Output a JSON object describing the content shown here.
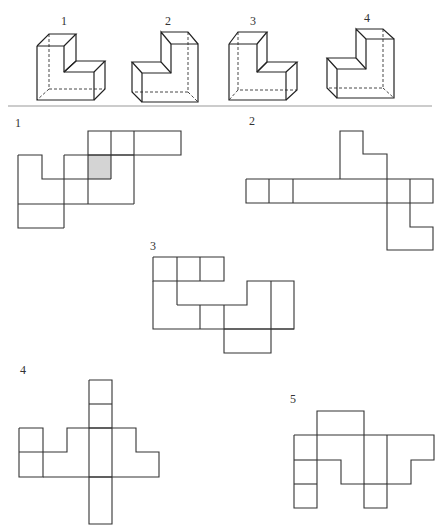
{
  "divider": {
    "x1": 8,
    "x2": 432,
    "y": 106,
    "color": "#999999"
  },
  "solids": [
    {
      "label": "1",
      "label_pos": [
        61,
        25
      ],
      "solid": [
        [
          [
            37,
            46
          ],
          [
            64,
            46
          ],
          [
            64,
            72
          ],
          [
            94,
            72
          ],
          [
            94,
            100
          ],
          [
            37,
            100
          ],
          [
            37,
            46
          ]
        ],
        [
          [
            37,
            46
          ],
          [
            49,
            34
          ],
          [
            76,
            34
          ],
          [
            64,
            46
          ]
        ],
        [
          [
            76,
            34
          ],
          [
            76,
            61
          ],
          [
            64,
            72
          ]
        ],
        [
          [
            64,
            72
          ],
          [
            76,
            61
          ],
          [
            105,
            61
          ],
          [
            94,
            72
          ]
        ],
        [
          [
            105,
            61
          ],
          [
            105,
            89
          ],
          [
            94,
            100
          ]
        ]
      ],
      "thin": [],
      "dashed": [
        [
          [
            49,
            34
          ],
          [
            49,
            89
          ],
          [
            105,
            89
          ]
        ],
        [
          [
            49,
            89
          ],
          [
            37,
            100
          ]
        ]
      ]
    },
    {
      "label": "2",
      "label_pos": [
        165,
        25
      ],
      "solid": [
        [
          [
            142,
            73
          ],
          [
            171,
            73
          ],
          [
            171,
            44
          ],
          [
            198,
            44
          ],
          [
            198,
            102
          ],
          [
            142,
            102
          ],
          [
            142,
            73
          ]
        ],
        [
          [
            171,
            73
          ],
          [
            161,
            62
          ],
          [
            161,
            32
          ],
          [
            171,
            44
          ]
        ],
        [
          [
            161,
            32
          ],
          [
            188,
            32
          ],
          [
            198,
            44
          ]
        ],
        [
          [
            142,
            73
          ],
          [
            132,
            62
          ],
          [
            161,
            62
          ]
        ],
        [
          [
            132,
            62
          ],
          [
            132,
            92
          ],
          [
            142,
            102
          ]
        ]
      ],
      "thin": [],
      "dashed": [
        [
          [
            188,
            32
          ],
          [
            188,
            92
          ],
          [
            132,
            92
          ]
        ],
        [
          [
            188,
            92
          ],
          [
            198,
            102
          ]
        ]
      ]
    },
    {
      "label": "3",
      "label_pos": [
        250,
        25
      ],
      "solid": [
        [
          [
            229,
            44
          ],
          [
            257,
            44
          ],
          [
            257,
            72
          ],
          [
            286,
            72
          ],
          [
            286,
            100
          ],
          [
            229,
            100
          ],
          [
            229,
            44
          ]
        ],
        [
          [
            229,
            44
          ],
          [
            238,
            32
          ],
          [
            267,
            32
          ],
          [
            257,
            44
          ]
        ],
        [
          [
            267,
            32
          ],
          [
            267,
            62
          ],
          [
            257,
            72
          ]
        ],
        [
          [
            257,
            72
          ],
          [
            267,
            62
          ],
          [
            297,
            62
          ],
          [
            286,
            72
          ]
        ],
        [
          [
            297,
            62
          ],
          [
            297,
            90
          ],
          [
            286,
            100
          ]
        ]
      ],
      "thin": [],
      "dashed": [
        [
          [
            238,
            32
          ],
          [
            238,
            90
          ],
          [
            297,
            90
          ]
        ],
        [
          [
            238,
            90
          ],
          [
            229,
            100
          ]
        ]
      ]
    },
    {
      "label": "4",
      "label_pos": [
        364,
        22
      ],
      "solid": [
        [
          [
            337,
            69
          ],
          [
            366,
            69
          ],
          [
            366,
            39
          ],
          [
            394,
            39
          ],
          [
            394,
            98
          ],
          [
            337,
            98
          ],
          [
            337,
            69
          ]
        ],
        [
          [
            366,
            69
          ],
          [
            356,
            58
          ],
          [
            356,
            29
          ],
          [
            366,
            39
          ]
        ],
        [
          [
            356,
            29
          ],
          [
            383,
            29
          ],
          [
            394,
            39
          ]
        ],
        [
          [
            337,
            69
          ],
          [
            327,
            58
          ],
          [
            356,
            58
          ]
        ],
        [
          [
            327,
            58
          ],
          [
            327,
            88
          ],
          [
            337,
            98
          ]
        ]
      ],
      "thin": [],
      "dashed": [
        [
          [
            383,
            29
          ],
          [
            383,
            88
          ],
          [
            327,
            88
          ]
        ],
        [
          [
            383,
            88
          ],
          [
            394,
            98
          ]
        ]
      ]
    }
  ],
  "nets": [
    {
      "label": "1",
      "label_pos": [
        15,
        127
      ],
      "shaded": [
        [
          88,
          155,
          23,
          24
        ]
      ],
      "lines": [
        [
          [
            88,
            155
          ],
          [
            88,
            131
          ],
          [
            181,
            131
          ],
          [
            181,
            155
          ],
          [
            88,
            155
          ]
        ],
        [
          [
            111,
            131
          ],
          [
            111,
            179
          ]
        ],
        [
          [
            134,
            131
          ],
          [
            134,
            204
          ]
        ],
        [
          [
            18,
            155
          ],
          [
            42,
            155
          ],
          [
            42,
            179
          ],
          [
            88,
            179
          ]
        ],
        [
          [
            64,
            155
          ],
          [
            134,
            155
          ]
        ],
        [
          [
            64,
            155
          ],
          [
            64,
            228
          ]
        ],
        [
          [
            88,
            155
          ],
          [
            88,
            204
          ]
        ],
        [
          [
            18,
            155
          ],
          [
            18,
            228
          ],
          [
            64,
            228
          ]
        ],
        [
          [
            18,
            204
          ],
          [
            134,
            204
          ]
        ],
        [
          [
            88,
            179
          ],
          [
            111,
            179
          ]
        ]
      ]
    },
    {
      "label": "2",
      "label_pos": [
        249,
        125
      ],
      "shaded": [],
      "lines": [
        [
          [
            246,
            179
          ],
          [
            433,
            179
          ],
          [
            433,
            203
          ],
          [
            246,
            203
          ],
          [
            246,
            179
          ]
        ],
        [
          [
            269,
            179
          ],
          [
            269,
            203
          ]
        ],
        [
          [
            293,
            179
          ],
          [
            293,
            203
          ]
        ],
        [
          [
            340,
            179
          ],
          [
            340,
            131
          ],
          [
            363,
            131
          ],
          [
            363,
            154
          ],
          [
            387,
            154
          ],
          [
            387,
            179
          ]
        ],
        [
          [
            387,
            179
          ],
          [
            387,
            250
          ],
          [
            433,
            250
          ],
          [
            433,
            227
          ],
          [
            410,
            227
          ],
          [
            410,
            179
          ]
        ]
      ]
    },
    {
      "label": "3",
      "label_pos": [
        150,
        250
      ],
      "shaded": [],
      "lines": [
        [
          [
            153,
            257
          ],
          [
            224,
            257
          ],
          [
            224,
            281
          ],
          [
            153,
            281
          ],
          [
            153,
            257
          ]
        ],
        [
          [
            177,
            257
          ],
          [
            177,
            305
          ]
        ],
        [
          [
            200,
            257
          ],
          [
            200,
            281
          ]
        ],
        [
          [
            153,
            281
          ],
          [
            153,
            329
          ],
          [
            224,
            329
          ]
        ],
        [
          [
            177,
            305
          ],
          [
            247,
            305
          ],
          [
            247,
            281
          ],
          [
            294,
            281
          ],
          [
            294,
            329
          ],
          [
            224,
            329
          ]
        ],
        [
          [
            200,
            305
          ],
          [
            200,
            329
          ]
        ],
        [
          [
            271,
            281
          ],
          [
            271,
            353
          ],
          [
            224,
            353
          ],
          [
            224,
            305
          ]
        ],
        [
          [
            224,
            329
          ],
          [
            294,
            329
          ]
        ]
      ]
    },
    {
      "label": "4",
      "label_pos": [
        20,
        374
      ],
      "shaded": [],
      "lines": [
        [
          [
            89,
            380
          ],
          [
            112,
            380
          ],
          [
            112,
            524
          ],
          [
            89,
            524
          ],
          [
            89,
            380
          ]
        ],
        [
          [
            89,
            404
          ],
          [
            112,
            404
          ]
        ],
        [
          [
            19,
            428
          ],
          [
            43,
            428
          ],
          [
            43,
            477
          ],
          [
            19,
            477
          ],
          [
            19,
            428
          ]
        ],
        [
          [
            19,
            452
          ],
          [
            67,
            452
          ],
          [
            67,
            428
          ],
          [
            136,
            428
          ],
          [
            136,
            452
          ],
          [
            159,
            452
          ],
          [
            159,
            477
          ],
          [
            43,
            477
          ]
        ],
        [
          [
            89,
            428
          ],
          [
            112,
            428
          ]
        ],
        [
          [
            89,
            477
          ],
          [
            112,
            477
          ]
        ]
      ]
    },
    {
      "label": "5",
      "label_pos": [
        290,
        403
      ],
      "shaded": [],
      "lines": [
        [
          [
            317,
            435
          ],
          [
            317,
            411
          ],
          [
            364,
            411
          ],
          [
            364,
            435
          ]
        ],
        [
          [
            294,
            435
          ],
          [
            434,
            435
          ],
          [
            434,
            460
          ],
          [
            411,
            460
          ],
          [
            411,
            484
          ],
          [
            387,
            484
          ],
          [
            387,
            508
          ],
          [
            364,
            508
          ],
          [
            364,
            484
          ],
          [
            341,
            484
          ],
          [
            341,
            460
          ],
          [
            317,
            460
          ]
        ],
        [
          [
            294,
            435
          ],
          [
            294,
            508
          ],
          [
            317,
            508
          ],
          [
            317,
            435
          ]
        ],
        [
          [
            294,
            460
          ],
          [
            317,
            460
          ]
        ],
        [
          [
            294,
            484
          ],
          [
            317,
            484
          ]
        ],
        [
          [
            364,
            435
          ],
          [
            364,
            484
          ]
        ],
        [
          [
            387,
            435
          ],
          [
            387,
            484
          ]
        ],
        [
          [
            364,
            484
          ],
          [
            387,
            484
          ]
        ]
      ]
    }
  ]
}
